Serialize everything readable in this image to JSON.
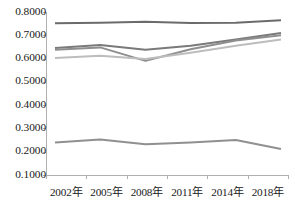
{
  "chart_data": {
    "type": "line",
    "title": "",
    "xlabel": "",
    "ylabel": "",
    "categories": [
      "2002年",
      "2005年",
      "2008年",
      "2011年",
      "2014年",
      "2018年"
    ],
    "ylim": [
      0.1,
      0.8
    ],
    "ytick_labels": [
      "0.8000",
      "0.7000",
      "0.6000",
      "0.5000",
      "0.4000",
      "0.3000",
      "0.2000",
      "0.1000"
    ],
    "ytick_values": [
      0.8,
      0.7,
      0.6,
      0.5,
      0.4,
      0.3,
      0.2,
      0.1
    ],
    "grid": false,
    "legend": "none",
    "series": [
      {
        "name": "series-1",
        "color": "#6b6b6b",
        "values": [
          0.752,
          0.754,
          0.758,
          0.753,
          0.754,
          0.765
        ]
      },
      {
        "name": "series-2",
        "color": "#7a7a7a",
        "values": [
          0.645,
          0.658,
          0.638,
          0.655,
          0.682,
          0.71
        ]
      },
      {
        "name": "series-3",
        "color": "#8f8f8f",
        "values": [
          0.638,
          0.648,
          0.59,
          0.64,
          0.678,
          0.7
        ]
      },
      {
        "name": "series-4",
        "color": "#bdbdbd",
        "values": [
          0.602,
          0.612,
          0.598,
          0.625,
          0.655,
          0.682
        ]
      },
      {
        "name": "series-5",
        "color": "#909090",
        "values": [
          0.24,
          0.252,
          0.232,
          0.24,
          0.25,
          0.212
        ]
      }
    ]
  },
  "axis": {
    "line_color": "#b0b0b0",
    "tick_color": "#b0b0b0",
    "label_color": "#1a1a1a"
  }
}
